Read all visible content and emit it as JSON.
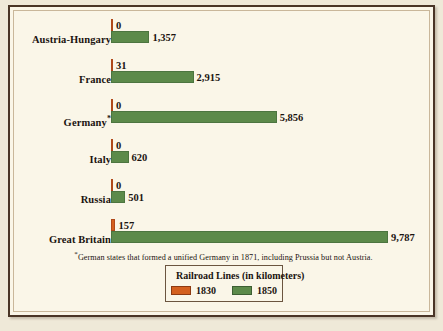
{
  "chart_data": {
    "type": "bar",
    "orientation": "horizontal",
    "title": "Railroad Lines (in kilometers)",
    "xlabel": "",
    "ylabel": "",
    "grid": false,
    "legend_position": "bottom-center",
    "xlim": [
      0,
      9787
    ],
    "categories": [
      "Austria-Hungary",
      "France",
      "Germany*",
      "Italy",
      "Russia",
      "Great Britain"
    ],
    "series": [
      {
        "name": "1830",
        "color": "#d4601f",
        "values": [
          0,
          31,
          0,
          0,
          0,
          157
        ]
      },
      {
        "name": "1850",
        "color": "#5c8a4a",
        "values": [
          1357,
          2915,
          5856,
          620,
          501,
          9787
        ]
      }
    ],
    "data_labels": [
      {
        "category": "Austria-Hungary",
        "v1830": "0",
        "v1850": "1,357"
      },
      {
        "category": "France",
        "v1830": "31",
        "v1850": "2,915"
      },
      {
        "category": "Germany*",
        "v1830": "0",
        "v1850": "5,856"
      },
      {
        "category": "Italy",
        "v1830": "0",
        "v1850": "620"
      },
      {
        "category": "Russia",
        "v1830": "0",
        "v1850": "501"
      },
      {
        "category": "Great Britain",
        "v1830": "157",
        "v1850": "9,787"
      }
    ],
    "footnote": "*German states that formed a unified Germany in 1871, including Prussia but not Austria."
  },
  "rows": [
    {
      "label": "Austria-Hungary",
      "label_plain": "Austria-Hungary",
      "star": "",
      "v1830": "0",
      "v1850": "1,357"
    },
    {
      "label": "France",
      "label_plain": "France",
      "star": "",
      "v1830": "31",
      "v1850": "2,915"
    },
    {
      "label": "Germany",
      "label_plain": "Germany*",
      "star": "*",
      "v1830": "0",
      "v1850": "5,856"
    },
    {
      "label": "Italy",
      "label_plain": "Italy",
      "star": "",
      "v1830": "0",
      "v1850": "620"
    },
    {
      "label": "Russia",
      "label_plain": "Russia",
      "star": "",
      "v1830": "0",
      "v1850": "501"
    },
    {
      "label": "Great Britain",
      "label_plain": "Great Britain",
      "star": "",
      "v1830": "157",
      "v1850": "9,787"
    }
  ],
  "footnote": {
    "marker": "*",
    "text": "German states that formed a unified Germany in 1871, including Prussia but not Austria."
  },
  "legend": {
    "title": "Railroad Lines (in kilometers)",
    "items": [
      {
        "label": "1830",
        "color": "#d4601f"
      },
      {
        "label": "1850",
        "color": "#5c8a4a"
      }
    ]
  },
  "colors": {
    "background": "#faf6e8",
    "page": "#efe9d8",
    "frame": "#4a3526",
    "bar_1830": "#d4601f",
    "bar_1850": "#5c8a4a",
    "text": "#1a1410"
  }
}
